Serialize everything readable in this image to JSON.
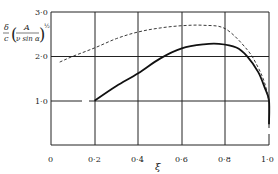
{
  "chart_data": {
    "type": "line",
    "title": "",
    "xlabel": "ξ",
    "ylabel": "δ/c (A / ν sin α)^½",
    "xlim": [
      0,
      1.0
    ],
    "ylim": [
      0,
      3.0
    ],
    "grid": true,
    "x_ticks": [
      "0",
      "0·2",
      "0·4",
      "0·6",
      "0·8",
      "1·0"
    ],
    "y_ticks": [
      "1·0",
      "2·0",
      "3·0"
    ],
    "legend": "none",
    "series": [
      {
        "name": "solid",
        "style": "solid",
        "x": [
          0.2,
          0.3,
          0.4,
          0.5,
          0.6,
          0.7,
          0.77,
          0.85,
          0.9,
          0.95,
          0.98,
          1.0,
          1.0
        ],
        "y": [
          1.0,
          1.33,
          1.62,
          1.95,
          2.18,
          2.27,
          2.28,
          2.2,
          2.0,
          1.65,
          1.3,
          1.0,
          0.47
        ]
      },
      {
        "name": "dashed",
        "style": "dashed",
        "x": [
          0.04,
          0.1,
          0.2,
          0.3,
          0.4,
          0.5,
          0.6,
          0.7,
          0.8,
          0.9,
          0.95,
          0.98,
          1.0
        ],
        "y": [
          1.87,
          2.0,
          2.19,
          2.4,
          2.55,
          2.64,
          2.69,
          2.7,
          2.62,
          2.15,
          1.75,
          1.4,
          1.0
        ]
      }
    ]
  },
  "labels": {
    "ylabel_line1": "δ ⎛ A ⎞½",
    "ylabel_delta": "δ",
    "ylabel_c": "c",
    "ylabel_A": "A",
    "ylabel_den": "ν sin α",
    "ylabel_exp": "½",
    "xlabel": "ξ",
    "origin": "0",
    "xt1": "0·2",
    "xt2": "0·4",
    "xt3": "0·6",
    "xt4": "0·8",
    "xt5": "1·0",
    "yt1": "1·0",
    "yt2": "2·0",
    "yt3": "3·0"
  }
}
